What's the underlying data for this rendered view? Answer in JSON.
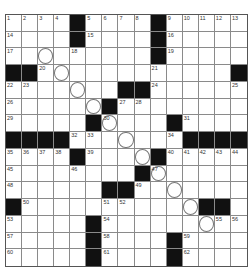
{
  "puzzle": {
    "size": {
      "rows": 15,
      "cols": 15
    },
    "grid": [
      "....#....#.....",
      "....#....#.....",
      ".........#.....",
      "##............#",
      ".......##......",
      "......#........",
      ".....#....#....",
      "####.......####",
      "....#....#.....",
      "........#......",
      "......##.......",
      "#...........##.",
      ".....#.........",
      ".....#....#....",
      ".....#....#...."
    ],
    "numbers": [
      {
        "r": 0,
        "c": 0,
        "n": "1"
      },
      {
        "r": 0,
        "c": 1,
        "n": "2"
      },
      {
        "r": 0,
        "c": 2,
        "n": "3"
      },
      {
        "r": 0,
        "c": 3,
        "n": "4"
      },
      {
        "r": 0,
        "c": 5,
        "n": "5"
      },
      {
        "r": 0,
        "c": 6,
        "n": "6"
      },
      {
        "r": 0,
        "c": 7,
        "n": "7"
      },
      {
        "r": 0,
        "c": 8,
        "n": "8"
      },
      {
        "r": 0,
        "c": 10,
        "n": "9"
      },
      {
        "r": 0,
        "c": 11,
        "n": "10"
      },
      {
        "r": 0,
        "c": 12,
        "n": "11"
      },
      {
        "r": 0,
        "c": 13,
        "n": "12"
      },
      {
        "r": 0,
        "c": 14,
        "n": "13"
      },
      {
        "r": 1,
        "c": 0,
        "n": "14"
      },
      {
        "r": 1,
        "c": 5,
        "n": "15"
      },
      {
        "r": 1,
        "c": 10,
        "n": "16"
      },
      {
        "r": 2,
        "c": 0,
        "n": "17"
      },
      {
        "r": 2,
        "c": 4,
        "n": "18"
      },
      {
        "r": 2,
        "c": 10,
        "n": "19"
      },
      {
        "r": 3,
        "c": 2,
        "n": "20"
      },
      {
        "r": 3,
        "c": 9,
        "n": "21"
      },
      {
        "r": 4,
        "c": 0,
        "n": "22"
      },
      {
        "r": 4,
        "c": 1,
        "n": "23"
      },
      {
        "r": 4,
        "c": 9,
        "n": "24"
      },
      {
        "r": 4,
        "c": 14,
        "n": "25"
      },
      {
        "r": 5,
        "c": 0,
        "n": "26"
      },
      {
        "r": 5,
        "c": 7,
        "n": "27"
      },
      {
        "r": 5,
        "c": 8,
        "n": "28"
      },
      {
        "r": 6,
        "c": 0,
        "n": "29"
      },
      {
        "r": 6,
        "c": 6,
        "n": "30"
      },
      {
        "r": 6,
        "c": 11,
        "n": "31"
      },
      {
        "r": 7,
        "c": 4,
        "n": "32"
      },
      {
        "r": 7,
        "c": 5,
        "n": "33"
      },
      {
        "r": 7,
        "c": 10,
        "n": "34"
      },
      {
        "r": 8,
        "c": 0,
        "n": "35"
      },
      {
        "r": 8,
        "c": 1,
        "n": "36"
      },
      {
        "r": 8,
        "c": 2,
        "n": "37"
      },
      {
        "r": 8,
        "c": 3,
        "n": "38"
      },
      {
        "r": 8,
        "c": 5,
        "n": "39"
      },
      {
        "r": 8,
        "c": 10,
        "n": "40"
      },
      {
        "r": 8,
        "c": 11,
        "n": "41"
      },
      {
        "r": 8,
        "c": 12,
        "n": "42"
      },
      {
        "r": 8,
        "c": 13,
        "n": "43"
      },
      {
        "r": 8,
        "c": 14,
        "n": "44"
      },
      {
        "r": 9,
        "c": 0,
        "n": "45"
      },
      {
        "r": 9,
        "c": 4,
        "n": "46"
      },
      {
        "r": 9,
        "c": 9,
        "n": "47"
      },
      {
        "r": 10,
        "c": 0,
        "n": "48"
      },
      {
        "r": 10,
        "c": 8,
        "n": "49"
      },
      {
        "r": 11,
        "c": 1,
        "n": "50"
      },
      {
        "r": 11,
        "c": 6,
        "n": "51"
      },
      {
        "r": 11,
        "c": 7,
        "n": "52"
      },
      {
        "r": 12,
        "c": 0,
        "n": "53"
      },
      {
        "r": 12,
        "c": 6,
        "n": "54"
      },
      {
        "r": 12,
        "c": 13,
        "n": "55"
      },
      {
        "r": 12,
        "c": 14,
        "n": "56"
      },
      {
        "r": 13,
        "c": 0,
        "n": "57"
      },
      {
        "r": 13,
        "c": 6,
        "n": "58"
      },
      {
        "r": 13,
        "c": 11,
        "n": "59"
      },
      {
        "r": 14,
        "c": 0,
        "n": "60"
      },
      {
        "r": 14,
        "c": 6,
        "n": "61"
      },
      {
        "r": 14,
        "c": 11,
        "n": "62"
      }
    ],
    "circles": [
      [
        2,
        2
      ],
      [
        3,
        3
      ],
      [
        4,
        4
      ],
      [
        5,
        5
      ],
      [
        6,
        6
      ],
      [
        7,
        7
      ],
      [
        8,
        8
      ],
      [
        9,
        9
      ],
      [
        10,
        10
      ],
      [
        11,
        11
      ],
      [
        12,
        12
      ]
    ],
    "colors": {
      "black": "#111111",
      "line": "#8a8a8a",
      "white": "#ffffff"
    }
  }
}
